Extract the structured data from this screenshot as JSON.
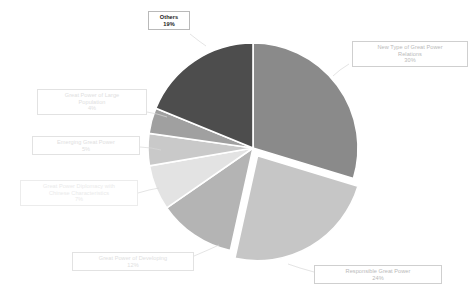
{
  "chart_data": {
    "type": "pie",
    "title": "",
    "subtitle": "",
    "xlabel": "",
    "ylabel": "",
    "legend_position": "callout-labels",
    "grid": false,
    "unit": "%",
    "categories": [
      "New Type of Great Power Relations",
      "Responsible Great Power",
      "Great Power of Developing",
      "Great Power Diplomacy with Chinese Characteristics",
      "Emerging Great Power",
      "Great Power of Large Population",
      "Others"
    ],
    "values": [
      30,
      24,
      12,
      7,
      5,
      4,
      19
    ],
    "colors": [
      "#8a8a8a",
      "#c6c6c6",
      "#b4b4b4",
      "#e3e3e3",
      "#c9c9c9",
      "#a0a0a0",
      "#4d4d4d"
    ],
    "exploded": [
      "Responsible Great Power"
    ],
    "start_angle_deg": 0,
    "direction": "clockwise",
    "slices": [
      {
        "label": "New Type of Great Power Relations",
        "value": 30,
        "display": "30%",
        "color": "#8a8a8a",
        "exploded": false
      },
      {
        "label": "Responsible Great Power",
        "value": 24,
        "display": "24%",
        "color": "#c6c6c6",
        "exploded": true
      },
      {
        "label": "Great Power of Developing",
        "value": 12,
        "display": "12%",
        "color": "#b4b4b4",
        "exploded": false
      },
      {
        "label": "Great Power Diplomacy with Chinese Characteristics",
        "value": 7,
        "display": "7%",
        "color": "#e3e3e3",
        "exploded": false
      },
      {
        "label": "Emerging Great Power",
        "value": 5,
        "display": "5%",
        "color": "#c9c9c9",
        "exploded": false
      },
      {
        "label": "Great Power of Large Population",
        "value": 4,
        "display": "4%",
        "color": "#a0a0a0",
        "exploded": false
      },
      {
        "label": "Others",
        "value": 19,
        "display": "19%",
        "color": "#4d4d4d",
        "exploded": false
      }
    ]
  },
  "labels": {
    "new_type": {
      "title": "New Type of Great Power",
      "title2": "Relations",
      "pct": "30%"
    },
    "responsible": {
      "title": "Responsible Great Power",
      "pct": "24%"
    },
    "developing": {
      "title": "Great Power of Developing",
      "pct": "12%"
    },
    "diplomacy": {
      "title": "Great Power Diplomacy with",
      "title2": "Chinese Characteristics",
      "pct": "7%"
    },
    "emerging": {
      "title": "Emerging Great Power",
      "pct": "5%"
    },
    "population": {
      "title": "Great Power of Large",
      "title2": "Population",
      "pct": "4%"
    },
    "others": {
      "title": "Others",
      "pct": "19%"
    }
  },
  "geometry": {
    "center_x": 253,
    "center_y": 148,
    "radius": 105
  }
}
